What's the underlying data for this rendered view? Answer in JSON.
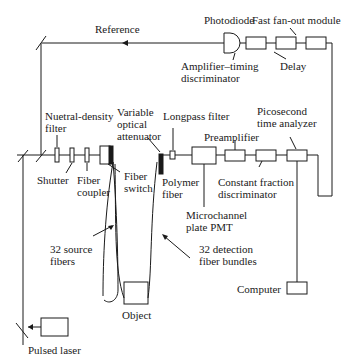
{
  "diagram": {
    "labels": {
      "reference": "Reference",
      "photodiode": "Photodiode",
      "fanout": "Fast fan-out module",
      "amp_timing_1": "Amplifier–timing",
      "amp_timing_2": "discriminator",
      "delay": "Delay",
      "nd_filter_1": "Nuetral-density",
      "nd_filter_2": "filter",
      "var_att_1": "Variable",
      "var_att_2": "optical",
      "var_att_3": "attenuator",
      "longpass": "Longpass filter",
      "pico_1": "Picosecond",
      "pico_2": "time analyzer",
      "preamp": "Preamplifier",
      "shutter": "Shutter",
      "fiber_coupler_1": "Fiber",
      "fiber_coupler_2": "coupler",
      "fiber_switch_1": "Fiber",
      "fiber_switch_2": "switch",
      "polymer_1": "Polymer",
      "polymer_2": "fiber",
      "cfd_1": "Constant fraction",
      "cfd_2": "discriminator",
      "mcp_1": "Microchannel",
      "mcp_2": "plate PMT",
      "source_fibers_1": "32 source",
      "source_fibers_2": "fibers",
      "detection_1": "32 detection",
      "detection_2": "fiber bundles",
      "object": "Object",
      "computer": "Computer",
      "pulsed_laser": "Pulsed laser"
    }
  }
}
